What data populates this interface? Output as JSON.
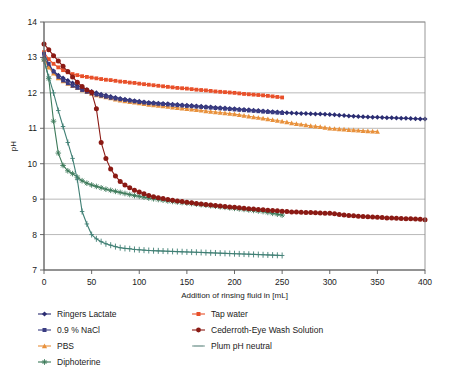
{
  "chart_data": {
    "type": "line",
    "title": "",
    "xlabel": "Addition of rinsing fluid in [mL]",
    "ylabel": "pH",
    "xlim": [
      0,
      400
    ],
    "ylim": [
      7,
      14
    ],
    "xticks": [
      0,
      50,
      100,
      150,
      200,
      250,
      300,
      350,
      400
    ],
    "yticks": [
      7,
      8,
      9,
      10,
      11,
      12,
      13,
      14
    ],
    "grid": "horizontal",
    "legend_position": "bottom",
    "series": [
      {
        "name": "Ringers Lactate",
        "color": "#2b2d72",
        "marker": "diamond",
        "x": [
          0,
          5,
          10,
          15,
          20,
          25,
          30,
          35,
          40,
          45,
          50,
          55,
          60,
          65,
          70,
          75,
          80,
          85,
          90,
          95,
          100,
          110,
          120,
          130,
          140,
          150,
          160,
          170,
          180,
          190,
          200,
          210,
          220,
          230,
          240,
          250,
          260,
          270,
          280,
          290,
          300,
          310,
          320,
          330,
          340,
          350,
          360,
          370,
          380,
          390,
          400
        ],
        "y": [
          13.0,
          12.75,
          12.62,
          12.5,
          12.42,
          12.35,
          12.28,
          12.2,
          12.14,
          12.09,
          12.04,
          12.0,
          11.96,
          11.93,
          11.9,
          11.87,
          11.84,
          11.82,
          11.8,
          11.78,
          11.76,
          11.73,
          11.71,
          11.69,
          11.67,
          11.65,
          11.63,
          11.61,
          11.59,
          11.57,
          11.55,
          11.53,
          11.51,
          11.49,
          11.47,
          11.45,
          11.43,
          11.42,
          11.41,
          11.4,
          11.39,
          11.37,
          11.35,
          11.33,
          11.32,
          11.31,
          11.3,
          11.29,
          11.28,
          11.27,
          11.26
        ]
      },
      {
        "name": "0.9 % NaCl",
        "color": "#3a3c82",
        "marker": "square",
        "x": [
          0,
          5,
          10,
          15,
          20,
          25,
          30,
          35,
          40,
          45,
          50,
          55,
          60,
          65,
          70,
          75,
          80,
          85,
          90,
          95,
          100,
          110,
          120,
          130,
          140,
          150,
          160,
          170,
          180,
          190,
          200,
          210,
          220,
          230,
          240,
          250
        ],
        "y": [
          13.1,
          12.82,
          12.6,
          12.45,
          12.35,
          12.27,
          12.2,
          12.14,
          12.08,
          12.03,
          11.99,
          11.95,
          11.92,
          11.89,
          11.86,
          11.84,
          11.82,
          11.8,
          11.78,
          11.76,
          11.74,
          11.71,
          11.69,
          11.67,
          11.65,
          11.63,
          11.61,
          11.59,
          11.57,
          11.55,
          11.53,
          11.51,
          11.49,
          11.47,
          11.45,
          11.43
        ]
      },
      {
        "name": "PBS",
        "color": "#e8913c",
        "marker": "triangle",
        "x": [
          0,
          5,
          10,
          15,
          20,
          25,
          30,
          35,
          40,
          45,
          50,
          55,
          60,
          65,
          70,
          75,
          80,
          85,
          90,
          95,
          100,
          110,
          120,
          130,
          140,
          150,
          160,
          170,
          180,
          190,
          200,
          210,
          220,
          230,
          240,
          250,
          260,
          270,
          280,
          290,
          300,
          310,
          320,
          330,
          340,
          350
        ],
        "y": [
          12.95,
          12.72,
          12.55,
          12.42,
          12.33,
          12.26,
          12.2,
          12.14,
          12.08,
          12.03,
          11.98,
          11.94,
          11.91,
          11.88,
          11.85,
          11.82,
          11.79,
          11.77,
          11.75,
          11.73,
          11.71,
          11.67,
          11.64,
          11.61,
          11.58,
          11.55,
          11.52,
          11.49,
          11.46,
          11.43,
          11.4,
          11.36,
          11.32,
          11.28,
          11.24,
          11.2,
          11.15,
          11.11,
          11.07,
          11.04,
          11.0,
          10.98,
          10.96,
          10.94,
          10.92,
          10.91
        ]
      },
      {
        "name": "Diphoterine",
        "color": "#3d7a5a",
        "marker": "star",
        "x": [
          0,
          5,
          10,
          15,
          20,
          25,
          30,
          35,
          40,
          45,
          50,
          55,
          60,
          65,
          70,
          75,
          80,
          85,
          90,
          95,
          100,
          110,
          120,
          130,
          140,
          150,
          160,
          170,
          180,
          190,
          200,
          210,
          220,
          230,
          240,
          250
        ],
        "y": [
          12.95,
          12.4,
          11.2,
          10.3,
          9.95,
          9.8,
          9.72,
          9.62,
          9.52,
          9.45,
          9.4,
          9.36,
          9.32,
          9.28,
          9.25,
          9.22,
          9.19,
          9.16,
          9.13,
          9.1,
          9.08,
          9.03,
          8.99,
          8.95,
          8.92,
          8.89,
          8.86,
          8.83,
          8.8,
          8.77,
          8.74,
          8.71,
          8.68,
          8.65,
          8.6,
          8.55
        ]
      },
      {
        "name": "Tap water",
        "color": "#e8502a",
        "marker": "square",
        "x": [
          0,
          5,
          10,
          15,
          20,
          25,
          30,
          35,
          40,
          45,
          50,
          55,
          60,
          65,
          70,
          75,
          80,
          85,
          90,
          95,
          100,
          110,
          120,
          130,
          140,
          150,
          160,
          170,
          180,
          190,
          200,
          210,
          220,
          230,
          240,
          250
        ],
        "y": [
          13.15,
          12.95,
          12.82,
          12.72,
          12.64,
          12.58,
          12.53,
          12.5,
          12.47,
          12.45,
          12.43,
          12.41,
          12.39,
          12.37,
          12.36,
          12.34,
          12.32,
          12.31,
          12.29,
          12.28,
          12.26,
          12.23,
          12.2,
          12.17,
          12.14,
          12.12,
          12.09,
          12.07,
          12.04,
          12.02,
          12.0,
          11.97,
          11.95,
          11.93,
          11.9,
          11.87
        ]
      },
      {
        "name": "Cederroth-Eye Wash Solution",
        "color": "#8b1a14",
        "marker": "circle",
        "x": [
          0,
          5,
          10,
          15,
          20,
          25,
          30,
          35,
          40,
          45,
          50,
          55,
          60,
          65,
          70,
          75,
          80,
          85,
          90,
          95,
          100,
          110,
          120,
          130,
          140,
          150,
          160,
          170,
          180,
          190,
          200,
          210,
          220,
          230,
          240,
          250,
          260,
          270,
          280,
          290,
          300,
          310,
          320,
          330,
          340,
          350,
          360,
          370,
          380,
          390,
          400
        ],
        "y": [
          13.38,
          13.22,
          13.05,
          12.9,
          12.75,
          12.6,
          12.45,
          12.3,
          12.18,
          12.08,
          12.02,
          11.55,
          10.6,
          10.15,
          9.85,
          9.65,
          9.5,
          9.4,
          9.32,
          9.25,
          9.2,
          9.1,
          9.04,
          8.99,
          8.95,
          8.91,
          8.88,
          8.85,
          8.82,
          8.79,
          8.77,
          8.74,
          8.72,
          8.7,
          8.68,
          8.66,
          8.64,
          8.63,
          8.62,
          8.61,
          8.6,
          8.57,
          8.54,
          8.52,
          8.5,
          8.49,
          8.47,
          8.46,
          8.45,
          8.44,
          8.42
        ]
      },
      {
        "name": "Plum pH neutral",
        "color": "#3f7f74",
        "marker": "plus",
        "x": [
          0,
          5,
          10,
          15,
          20,
          25,
          30,
          35,
          40,
          45,
          50,
          55,
          60,
          65,
          70,
          75,
          80,
          85,
          90,
          95,
          100,
          110,
          120,
          130,
          140,
          150,
          160,
          170,
          180,
          190,
          200,
          210,
          220,
          230,
          240,
          250
        ],
        "y": [
          12.9,
          12.45,
          12.0,
          11.5,
          11.05,
          10.6,
          10.15,
          9.55,
          8.65,
          8.3,
          8.0,
          7.88,
          7.8,
          7.74,
          7.7,
          7.66,
          7.63,
          7.61,
          7.6,
          7.58,
          7.57,
          7.55,
          7.54,
          7.53,
          7.52,
          7.51,
          7.5,
          7.49,
          7.48,
          7.47,
          7.46,
          7.45,
          7.44,
          7.43,
          7.42,
          7.41
        ]
      }
    ]
  },
  "legend": {
    "items": [
      {
        "label": "Ringers Lactate",
        "color": "#2b2d72",
        "marker": "diamond"
      },
      {
        "label": "Tap water",
        "color": "#e8502a",
        "marker": "square"
      },
      {
        "label": "0.9 % NaCl",
        "color": "#3a3c82",
        "marker": "square"
      },
      {
        "label": "Cederroth-Eye Wash Solution",
        "color": "#8b1a14",
        "marker": "circle"
      },
      {
        "label": "PBS",
        "color": "#e8913c",
        "marker": "triangle"
      },
      {
        "label": "Plum pH neutral",
        "color": "#8aa8a2",
        "marker": "line"
      },
      {
        "label": "Diphoterine",
        "color": "#3d7a5a",
        "marker": "star"
      }
    ]
  }
}
